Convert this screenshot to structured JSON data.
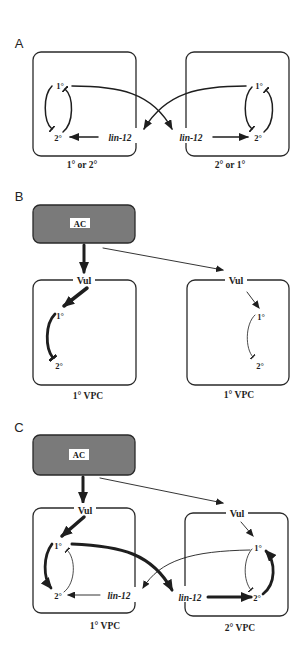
{
  "figure": {
    "panels": {
      "A": {
        "letter": "A",
        "left_cell": {
          "top_node": "1°",
          "bottom_node": "2°",
          "signal": "lin-12",
          "caption": "1° or 2°"
        },
        "right_cell": {
          "top_node": "1°",
          "bottom_node": "2°",
          "signal": "lin-12",
          "caption": "2° or 1°"
        }
      },
      "B": {
        "letter": "B",
        "anchor_cell": "AC",
        "left_cell": {
          "inductive_signal": "Vul",
          "top_node": "1°",
          "bottom_node": "2°",
          "caption": "1° VPC"
        },
        "right_cell": {
          "inductive_signal": "Vul",
          "top_node": "1°",
          "bottom_node": "2°",
          "caption": "1° VPC"
        }
      },
      "C": {
        "letter": "C",
        "anchor_cell": "AC",
        "left_cell": {
          "inductive_signal": "Vul",
          "top_node": "1°",
          "bottom_node": "2°",
          "signal": "lin-12",
          "caption": "1° VPC"
        },
        "right_cell": {
          "inductive_signal": "Vul",
          "top_node": "1°",
          "bottom_node": "2°",
          "signal": "lin-12",
          "caption": "2° VPC"
        }
      }
    }
  },
  "colors": {
    "background": "#ffffff",
    "ink": "#1e1e1e",
    "anchor_cell_fill": "#7a7a7a",
    "label_background": "#ffffff"
  }
}
